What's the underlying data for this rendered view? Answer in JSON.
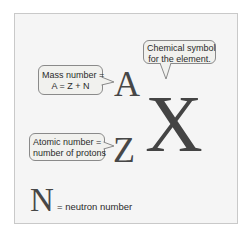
{
  "diagram": {
    "symbols": {
      "mass_number_symbol": "A",
      "atomic_number_symbol": "Z",
      "element_symbol": "X",
      "neutron_symbol": "N"
    },
    "callouts": {
      "mass_number": {
        "line1": "Mass number =",
        "line2": "A = Z + N"
      },
      "chemical_symbol": {
        "line1": "Chemical symbol",
        "line2": "for the element."
      },
      "atomic_number": {
        "line1": "Atomic number =",
        "line2": "number of protons"
      }
    },
    "legend": {
      "neutron_label": "= neutron number"
    },
    "colors": {
      "frame_bg": "#f5f5f5",
      "frame_border": "#c9c9c9",
      "callout_bg": "#f1f1ee",
      "callout_border": "#8a8a8a",
      "symbol_color": "#474747"
    }
  }
}
